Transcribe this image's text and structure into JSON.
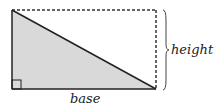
{
  "diagram": {
    "labels": {
      "height": "height",
      "base": "base"
    },
    "colors": {
      "fill": "#d9d9d9",
      "stroke": "#222222",
      "dashed": "#333333"
    }
  }
}
